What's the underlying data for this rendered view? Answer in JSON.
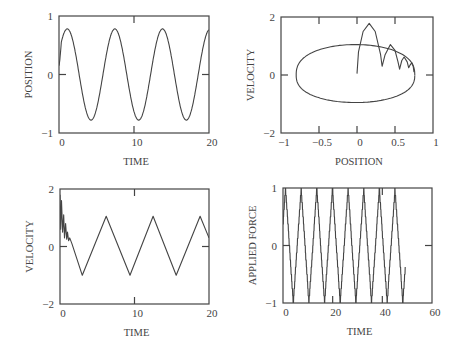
{
  "chart_data": [
    {
      "id": "position-vs-time",
      "type": "line",
      "title": "",
      "xlabel": "TIME",
      "ylabel": "POSITION",
      "xlim": [
        0,
        20
      ],
      "ylim": [
        -1,
        1
      ],
      "xticks": [
        0,
        10,
        20
      ],
      "yticks": [
        -1,
        0,
        1
      ],
      "grid": false,
      "frame": {
        "left": 59,
        "top": 16,
        "right": 209,
        "bottom": 133
      },
      "series": [
        {
          "name": "position",
          "model": "sine",
          "amplitude": 0.78,
          "period": 6.35,
          "phase_peak_t": 1.1,
          "peaks": [
            [
              1.1,
              0.79
            ],
            [
              7.5,
              0.79
            ],
            [
              13.8,
              0.79
            ]
          ],
          "troughs": [
            [
              4.3,
              -0.75
            ],
            [
              10.6,
              -0.75
            ],
            [
              17.0,
              -0.75
            ]
          ],
          "start": [
            0,
            0.15
          ],
          "end": [
            20,
            0.72
          ]
        }
      ]
    },
    {
      "id": "velocity-vs-position",
      "type": "line",
      "title": "",
      "xlabel": "POSITION",
      "ylabel": "VELOCITY",
      "xlim": [
        -1,
        1
      ],
      "ylim": [
        -2,
        2
      ],
      "xticks": [
        -1,
        -0.5,
        0,
        0.5,
        1
      ],
      "xticklabels": [
        "-1",
        "-0.5",
        "0",
        "0.5",
        "1"
      ],
      "yticks": [
        -2,
        0,
        2
      ],
      "grid": false,
      "frame": {
        "left": 281,
        "top": 17,
        "right": 433,
        "bottom": 133
      },
      "series": [
        {
          "name": "limit-cycle",
          "x_left": -0.8,
          "x_right": 0.76,
          "v_top": 1.05,
          "v_bottom": -0.95
        },
        {
          "name": "transient-arches",
          "points": [
            [
              0.0,
              0.05
            ],
            [
              0.02,
              0.8
            ],
            [
              0.08,
              1.5
            ],
            [
              0.16,
              1.78
            ],
            [
              0.24,
              1.5
            ],
            [
              0.31,
              0.7
            ],
            [
              0.33,
              0.3
            ],
            [
              0.37,
              0.7
            ],
            [
              0.44,
              1.05
            ],
            [
              0.5,
              0.85
            ],
            [
              0.54,
              0.45
            ],
            [
              0.56,
              0.2
            ],
            [
              0.59,
              0.5
            ],
            [
              0.62,
              0.62
            ],
            [
              0.66,
              0.45
            ],
            [
              0.68,
              0.25
            ],
            [
              0.7,
              0.35
            ],
            [
              0.72,
              0.42
            ],
            [
              0.74,
              0.3
            ],
            [
              0.75,
              0.1
            ]
          ]
        }
      ]
    },
    {
      "id": "velocity-vs-time",
      "type": "line",
      "title": "",
      "xlabel": "TIME",
      "ylabel": "VELOCITY",
      "xlim": [
        0,
        20
      ],
      "ylim": [
        -2,
        2
      ],
      "xticks": [
        0,
        10,
        20
      ],
      "yticks": [
        -2,
        0,
        2
      ],
      "grid": false,
      "frame": {
        "left": 60,
        "top": 189,
        "right": 209,
        "bottom": 304
      },
      "series": [
        {
          "name": "velocity",
          "points": [
            [
              0.0,
              1.8
            ],
            [
              0.1,
              0.6
            ],
            [
              0.2,
              1.6
            ],
            [
              0.35,
              0.5
            ],
            [
              0.5,
              1.1
            ],
            [
              0.6,
              0.3
            ],
            [
              0.75,
              0.8
            ],
            [
              0.9,
              0.25
            ],
            [
              1.0,
              0.5
            ],
            [
              1.15,
              0.2
            ],
            [
              1.3,
              0.3
            ],
            [
              1.6,
              0.1
            ],
            [
              3.0,
              -1.0
            ],
            [
              6.2,
              1.05
            ],
            [
              9.4,
              -1.0
            ],
            [
              12.5,
              1.05
            ],
            [
              15.6,
              -1.0
            ],
            [
              18.8,
              1.05
            ],
            [
              20.0,
              0.3
            ]
          ]
        }
      ]
    },
    {
      "id": "applied-force-vs-time",
      "type": "line",
      "title": "",
      "xlabel": "TIME",
      "ylabel": "APPLIED FORCE",
      "xlim": [
        0,
        60
      ],
      "ylim": [
        -1,
        1
      ],
      "xticks": [
        0,
        20,
        40,
        60
      ],
      "yticks": [
        -1,
        0,
        1
      ],
      "grid": false,
      "frame": {
        "left": 283,
        "top": 188,
        "right": 432,
        "bottom": 303
      },
      "series": [
        {
          "name": "force",
          "model": "stepped-triangle",
          "period": 6.3,
          "amplitude": 1.0,
          "first_peak_t": 1.0,
          "peaks_t": [
            1.0,
            7.3,
            13.6,
            19.9,
            26.2,
            32.5,
            38.8,
            45.0
          ],
          "troughs_t": [
            4.2,
            10.5,
            16.8,
            23.1,
            29.4,
            35.7,
            42.0,
            48.2
          ],
          "end": [
            49.2,
            -0.3
          ]
        }
      ]
    }
  ]
}
